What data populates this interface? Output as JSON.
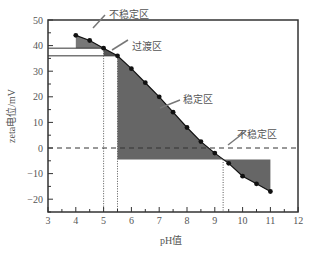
{
  "chart_data": {
    "type": "line",
    "title": "",
    "xlabel": "pH值",
    "ylabel": "zeta电位/mV",
    "xlim": [
      3,
      12
    ],
    "ylim": [
      -25,
      50
    ],
    "xticks": [
      3,
      4,
      5,
      6,
      7,
      8,
      9,
      10,
      11,
      12
    ],
    "yticks": [
      -20,
      -10,
      0,
      10,
      20,
      30,
      40,
      50
    ],
    "series": [
      {
        "name": "zeta",
        "x": [
          4,
          4.5,
          5,
          5.5,
          6,
          6.5,
          7,
          7.5,
          8,
          8.5,
          9,
          9.5,
          10,
          10.5,
          11
        ],
        "y": [
          44,
          42,
          39,
          36,
          31,
          25.5,
          20,
          14,
          8,
          2.5,
          -2,
          -6,
          -11,
          -14,
          -17
        ]
      }
    ],
    "annotations": [
      {
        "text": "不稳定区",
        "x": 5.9,
        "y": 45
      },
      {
        "text": "过渡区",
        "x": 6.2,
        "y": 38
      },
      {
        "text": "稳定区",
        "x": 7.6,
        "y": 14.5
      },
      {
        "text": "不稳定区",
        "x": 9.5,
        "y": 1.8
      },
      {
        "text": "不稳定区",
        "x": 9.5,
        "y": 2
      }
    ],
    "reference_lines": {
      "hline_dashed": 0,
      "hlines_solid": [
        39,
        36
      ],
      "vlines_dotted": [
        5,
        5.5,
        9.3
      ]
    }
  }
}
